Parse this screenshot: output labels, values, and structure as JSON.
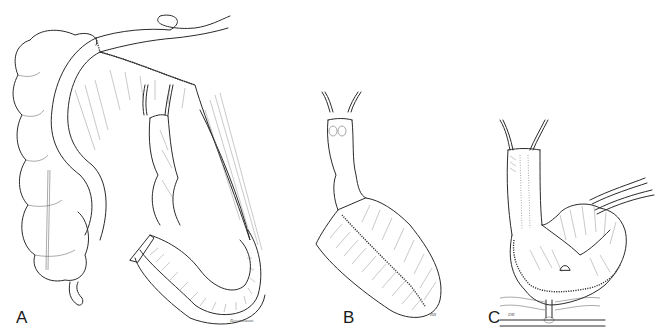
{
  "figure": {
    "panels": [
      {
        "id": "A",
        "label": "A",
        "signature": "Rosenbaum"
      },
      {
        "id": "B",
        "label": "B",
        "signature": "RB"
      },
      {
        "id": "C",
        "label": "C",
        "signature": "DR"
      }
    ],
    "colors": {
      "line": "#2a2a2a",
      "background": "#ffffff",
      "hatch": "#777777"
    }
  }
}
